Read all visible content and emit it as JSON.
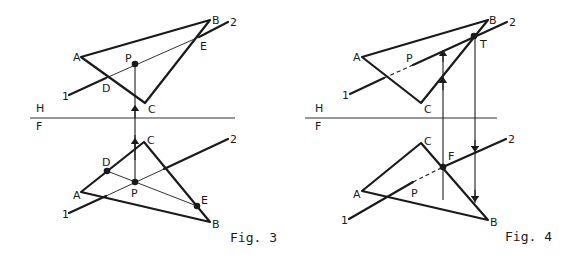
{
  "figures": [
    {
      "caption": "Fig. 3",
      "fold_line": {
        "top_label": "H",
        "bottom_label": "F"
      },
      "top_view": {
        "vertices": {
          "A": "A",
          "B": "B",
          "C": "C"
        },
        "line_ends": {
          "start": "1",
          "end": "2"
        },
        "points": {
          "P": "P",
          "D": "D",
          "E": "E"
        }
      },
      "front_view": {
        "vertices": {
          "A": "A",
          "B": "B",
          "C": "C"
        },
        "line_ends": {
          "start": "1",
          "end": "2"
        },
        "points": {
          "P": "P",
          "D": "D",
          "E": "E"
        }
      }
    },
    {
      "caption": "Fig. 4",
      "fold_line": {
        "top_label": "H",
        "bottom_label": "F"
      },
      "top_view": {
        "vertices": {
          "A": "A",
          "B": "B",
          "C": "C"
        },
        "line_ends": {
          "start": "1",
          "end": "2"
        },
        "points": {
          "P": "P",
          "T": "T"
        }
      },
      "front_view": {
        "vertices": {
          "A": "A",
          "B": "B",
          "C": "C"
        },
        "line_ends": {
          "start": "1",
          "end": "2"
        },
        "points": {
          "P": "P",
          "F": "F"
        }
      }
    }
  ]
}
